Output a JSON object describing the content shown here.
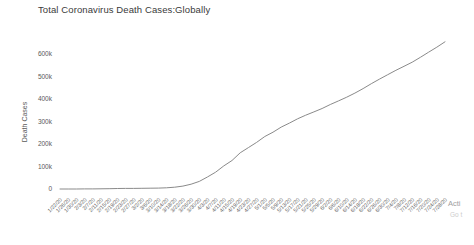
{
  "title": "Total Coronavirus Death Cases:Globally",
  "watermark": {
    "line1": "Acti",
    "line2": "Go t"
  },
  "chart_data": {
    "type": "line",
    "title": "Total Coronavirus Death Cases:Globally",
    "xlabel": "",
    "ylabel": "Death Cases",
    "legend_visible": false,
    "grid": false,
    "line_color": "#8a8a8a",
    "ylim": [
      0,
      680000
    ],
    "y_ticks": [
      "0",
      "100k",
      "200k",
      "300k",
      "400k",
      "500k",
      "600k"
    ],
    "y_tick_values": [
      0,
      100000,
      200000,
      300000,
      400000,
      500000,
      600000
    ],
    "x": [
      "1/22/20",
      "1/26/20",
      "1/30/20",
      "2/3/20",
      "2/7/20",
      "2/11/20",
      "2/15/20",
      "2/19/20",
      "2/23/20",
      "2/27/20",
      "3/2/20",
      "3/6/20",
      "3/10/20",
      "3/14/20",
      "3/18/20",
      "3/22/20",
      "3/26/20",
      "3/30/20",
      "4/3/20",
      "4/7/20",
      "4/11/20",
      "4/15/20",
      "4/19/20",
      "4/23/20",
      "4/27/20",
      "5/1/20",
      "5/5/20",
      "5/9/20",
      "5/13/20",
      "5/17/20",
      "5/21/20",
      "5/25/20",
      "5/29/20",
      "6/2/20",
      "6/6/20",
      "6/10/20",
      "6/14/20",
      "6/18/20",
      "6/22/20",
      "6/26/20",
      "6/30/20",
      "7/4/20",
      "7/8/20",
      "7/12/20",
      "7/16/20",
      "7/20/20",
      "7/24/20",
      "7/28/20"
    ],
    "values": [
      17,
      56,
      171,
      362,
      638,
      1016,
      1526,
      2012,
      2445,
      2770,
      3085,
      3461,
      4024,
      5420,
      8000,
      13000,
      21200,
      33900,
      53200,
      74800,
      102800,
      126600,
      160700,
      184200,
      207000,
      233400,
      252400,
      274900,
      292800,
      311800,
      328200,
      342800,
      357700,
      375600,
      391600,
      408000,
      426400,
      446100,
      468000,
      488500,
      508100,
      527700,
      545500,
      563400,
      585200,
      607800,
      630100,
      654300
    ]
  }
}
